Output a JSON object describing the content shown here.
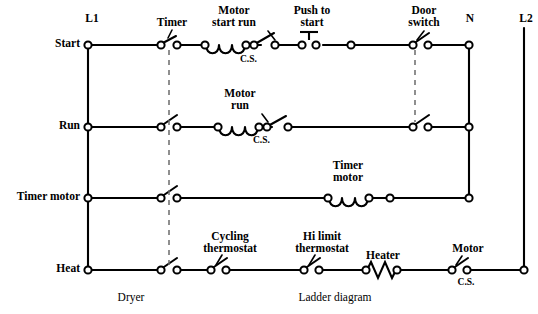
{
  "diagram": {
    "caption_left": "Dryer",
    "caption_right": "Ladder diagram",
    "line_color": "#000000",
    "link_color": "#6b6b6b",
    "background": "#ffffff",
    "power_rails": [
      {
        "id": "L1",
        "label": "L1",
        "side": "left"
      },
      {
        "id": "N",
        "label": "N",
        "side": "right"
      },
      {
        "id": "L2",
        "label": "L2",
        "side": "right"
      }
    ],
    "rungs": [
      {
        "id": "start",
        "label": "Start",
        "components": [
          {
            "type": "contact-no",
            "name": "timer-contact",
            "label": "Timer"
          },
          {
            "type": "coil",
            "name": "motor-start-run-coil",
            "label": "Motor\nstart run"
          },
          {
            "type": "contact-no",
            "name": "motor-cs-contact",
            "label": "C.S."
          },
          {
            "type": "pushbutton-no",
            "name": "push-to-start-button",
            "label": "Push to\nstart"
          },
          {
            "type": "node",
            "name": "junction-node"
          },
          {
            "type": "contact-no",
            "name": "door-switch-contact",
            "label": "Door\nswitch"
          }
        ]
      },
      {
        "id": "run",
        "label": "Run",
        "components": [
          {
            "type": "contact-no",
            "name": "timer-contact",
            "label": ""
          },
          {
            "type": "coil",
            "name": "motor-run-coil",
            "label": "Motor\nrun"
          },
          {
            "type": "contact-no",
            "name": "motor-cs-contact",
            "label": "C.S."
          },
          {
            "type": "contact-no",
            "name": "door-switch-contact",
            "label": ""
          }
        ]
      },
      {
        "id": "timer-motor",
        "label": "Timer motor",
        "components": [
          {
            "type": "contact-no",
            "name": "timer-contact",
            "label": ""
          },
          {
            "type": "coil",
            "name": "timer-motor-coil",
            "label": "Timer\nmotor"
          },
          {
            "type": "node",
            "name": "junction-node"
          }
        ]
      },
      {
        "id": "heat",
        "label": "Heat",
        "components": [
          {
            "type": "contact-no",
            "name": "timer-contact",
            "label": ""
          },
          {
            "type": "contact-no",
            "name": "cycling-thermostat-contact",
            "label": "Cycling\nthermostat"
          },
          {
            "type": "contact-no",
            "name": "hi-limit-thermostat-contact",
            "label": "Hi limit\nthermostat"
          },
          {
            "type": "resistor",
            "name": "heater-element",
            "label": "Heater"
          },
          {
            "type": "contact-no",
            "name": "motor-cs-contact",
            "label": "Motor\nC.S."
          }
        ]
      }
    ],
    "labels": {
      "rail_l1": "L1",
      "rail_n": "N",
      "rail_l2": "L2",
      "rung_start": "Start",
      "rung_run": "Run",
      "rung_timer_motor": "Timer motor",
      "rung_heat": "Heat",
      "timer": "Timer",
      "motor_start_run_1": "Motor",
      "motor_start_run_2": "start run",
      "cs_start": "C.S.",
      "push_to_start_1": "Push to",
      "push_to_start_2": "start",
      "door_switch_1": "Door",
      "door_switch_2": "switch",
      "motor_run_1": "Motor",
      "motor_run_2": "run",
      "cs_run": "C.S.",
      "timer_motor_1": "Timer",
      "timer_motor_2": "motor",
      "cycling_thermostat_1": "Cycling",
      "cycling_thermostat_2": "thermostat",
      "hi_limit_1": "Hi limit",
      "hi_limit_2": "thermostat",
      "heater": "Heater",
      "motor_cs_1": "Motor",
      "motor_cs_2": "C.S.",
      "caption_dryer": "Dryer",
      "caption_ladder": "Ladder diagram"
    }
  }
}
